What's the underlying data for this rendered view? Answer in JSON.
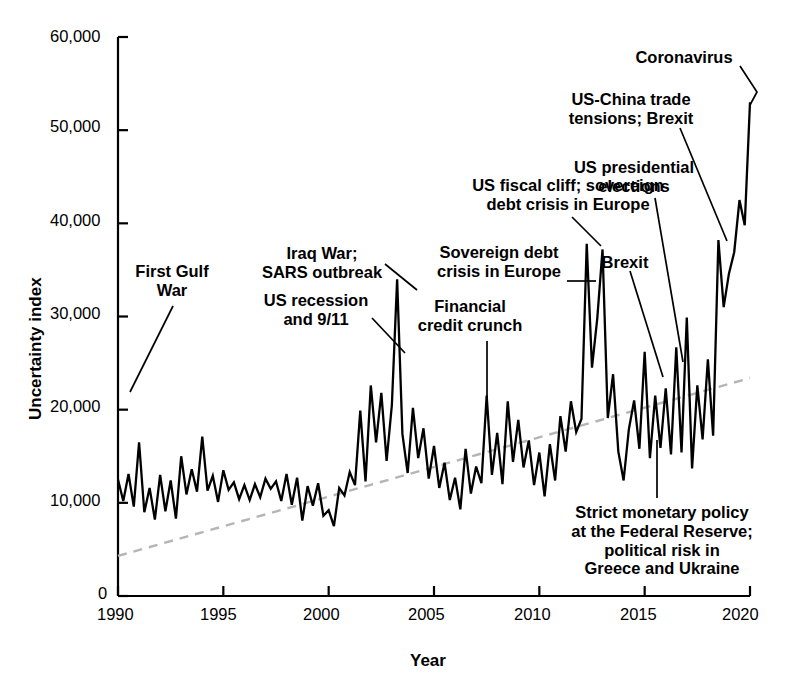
{
  "chart_data": {
    "type": "line",
    "title": "",
    "xlabel": "Year",
    "ylabel": "Uncertainty index",
    "xlim": [
      1990,
      2020
    ],
    "ylim": [
      0,
      60000
    ],
    "grid": false,
    "legend": "none",
    "xticks": [
      "1990",
      "1995",
      "2000",
      "2005",
      "2010",
      "2015",
      "2020"
    ],
    "xtick_values": [
      1990,
      1995,
      2000,
      2005,
      2010,
      2015,
      2020
    ],
    "yticks": [
      "0",
      "10,000",
      "20,000",
      "30,000",
      "40,000",
      "50,000",
      "60,000"
    ],
    "ytick_values": [
      0,
      10000,
      20000,
      30000,
      40000,
      50000,
      60000
    ],
    "series": [
      {
        "name": "Uncertainty index",
        "style": "solid",
        "color": "#000000",
        "x": [
          1990.0,
          1990.25,
          1990.5,
          1990.75,
          1991.0,
          1991.25,
          1991.5,
          1991.75,
          1992.0,
          1992.25,
          1992.5,
          1992.75,
          1993.0,
          1993.25,
          1993.5,
          1993.75,
          1994.0,
          1994.25,
          1994.5,
          1994.75,
          1995.0,
          1995.25,
          1995.5,
          1995.75,
          1996.0,
          1996.25,
          1996.5,
          1996.75,
          1997.0,
          1997.25,
          1997.5,
          1997.75,
          1998.0,
          1998.25,
          1998.5,
          1998.75,
          1999.0,
          1999.25,
          1999.5,
          1999.75,
          2000.0,
          2000.25,
          2000.5,
          2000.75,
          2001.0,
          2001.25,
          2001.5,
          2001.75,
          2002.0,
          2002.25,
          2002.5,
          2002.75,
          2003.0,
          2003.25,
          2003.5,
          2003.75,
          2004.0,
          2004.25,
          2004.5,
          2004.75,
          2005.0,
          2005.25,
          2005.5,
          2005.75,
          2006.0,
          2006.25,
          2006.5,
          2006.75,
          2007.0,
          2007.25,
          2007.5,
          2007.75,
          2008.0,
          2008.25,
          2008.5,
          2008.75,
          2009.0,
          2009.25,
          2009.5,
          2009.75,
          2010.0,
          2010.25,
          2010.5,
          2010.75,
          2011.0,
          2011.25,
          2011.5,
          2011.75,
          2012.0,
          2012.25,
          2012.5,
          2012.75,
          2013.0,
          2013.25,
          2013.5,
          2013.75,
          2014.0,
          2014.25,
          2014.5,
          2014.75,
          2015.0,
          2015.25,
          2015.5,
          2015.75,
          2016.0,
          2016.25,
          2016.5,
          2016.75,
          2017.0,
          2017.25,
          2017.5,
          2017.75,
          2018.0,
          2018.25,
          2018.5,
          2018.75,
          2019.0,
          2019.25,
          2019.5,
          2019.75,
          2020.0
        ],
        "values": [
          12500,
          10200,
          13100,
          9600,
          16500,
          9000,
          11600,
          8200,
          13000,
          9100,
          12400,
          8300,
          15000,
          10900,
          13600,
          11200,
          17100,
          11300,
          12900,
          10100,
          13500,
          11400,
          12200,
          10400,
          11900,
          10300,
          12000,
          10600,
          12600,
          11500,
          12300,
          10200,
          13100,
          9800,
          12700,
          8100,
          11800,
          9700,
          12100,
          8600,
          9200,
          7500,
          11600,
          10800,
          13300,
          11900,
          19900,
          12300,
          22600,
          16500,
          21800,
          14500,
          20500,
          34000,
          17400,
          13200,
          20200,
          14800,
          18000,
          12600,
          16100,
          11600,
          14300,
          10300,
          12700,
          9300,
          15800,
          11000,
          13900,
          12100,
          21500,
          13000,
          17500,
          12000,
          20900,
          14400,
          18900,
          13800,
          16700,
          11900,
          15400,
          10700,
          16300,
          12400,
          19300,
          15500,
          20900,
          17600,
          19000,
          37800,
          24500,
          29800,
          37200,
          19100,
          23800,
          15500,
          12400,
          17900,
          21000,
          15800,
          26200,
          14800,
          21500,
          15900,
          22300,
          15200,
          26700,
          15400,
          29900,
          13700,
          22600,
          16800,
          25400,
          17200,
          38200,
          31000,
          34600,
          36900,
          42500,
          39800,
          53000
        ]
      },
      {
        "name": "Trend",
        "style": "dashed",
        "color": "#b5b5b5",
        "x": [
          1990,
          2020
        ],
        "values": [
          4300,
          23400
        ]
      }
    ],
    "annotations": [
      {
        "id": "first-gulf-war",
        "text": [
          "First Gulf",
          "War"
        ],
        "align": "center",
        "text_x": 172,
        "text_y": 262,
        "leader": [
          [
            173,
            306
          ],
          [
            130,
            392
          ]
        ]
      },
      {
        "id": "us-recession-911",
        "text": [
          "US recession",
          "and 9/11"
        ],
        "align": "center",
        "text_x": 316,
        "text_y": 291,
        "leader": [
          [
            372,
            318
          ],
          [
            405,
            353
          ]
        ]
      },
      {
        "id": "iraq-war-sars",
        "text": [
          "Iraq War;",
          "SARS outbreak"
        ],
        "align": "center",
        "text_x": 322,
        "text_y": 244,
        "leader": [
          [
            385,
            264
          ],
          [
            417,
            290
          ]
        ]
      },
      {
        "id": "financial-credit-crunch",
        "text": [
          "Financial",
          "credit crunch"
        ],
        "align": "center",
        "text_x": 470,
        "text_y": 297,
        "leader": [
          [
            487,
            341
          ],
          [
            487,
            399
          ]
        ]
      },
      {
        "id": "us-fiscal-cliff",
        "text": [
          "US fiscal cliff; sovereign",
          "debt crisis in Europe"
        ],
        "align": "center",
        "text_x": 568,
        "text_y": 176,
        "leader": [
          [
            572,
            217
          ],
          [
            601,
            246
          ]
        ]
      },
      {
        "id": "sovereign-debt-crisis",
        "text": [
          "Sovereign debt",
          "crisis in Europe"
        ],
        "align": "center",
        "text_x": 499,
        "text_y": 243,
        "leader": [
          [
            567,
            281
          ],
          [
            596,
            281
          ]
        ]
      },
      {
        "id": "brexit-2016",
        "text": [
          "Brexit"
        ],
        "align": "center",
        "text_x": 625,
        "text_y": 253,
        "leader": [
          [
            630,
            271
          ],
          [
            663,
            377
          ]
        ]
      },
      {
        "id": "us-presidential-elections",
        "text": [
          "US presidential",
          "elections"
        ],
        "align": "center",
        "text_x": 634,
        "text_y": 158,
        "leader": [
          [
            655,
            198
          ],
          [
            683,
            362
          ]
        ]
      },
      {
        "id": "us-china-trade-brexit",
        "text": [
          "US-China trade",
          "tensions; Brexit"
        ],
        "align": "center",
        "text_x": 631,
        "text_y": 90,
        "leader": [
          [
            680,
            128
          ],
          [
            727,
            241
          ]
        ]
      },
      {
        "id": "coronavirus",
        "text": [
          "Coronavirus"
        ],
        "align": "center",
        "text_x": 684,
        "text_y": 48,
        "leader": [
          [
            740,
            66
          ],
          [
            757,
            92
          ],
          [
            750,
            105
          ]
        ]
      },
      {
        "id": "strict-monetary-policy",
        "text": [
          "Strict monetary policy",
          "at the Federal Reserve;",
          "political risk in",
          "Greece and Ukraine"
        ],
        "align": "center",
        "text_x": 662,
        "text_y": 503,
        "leader": [
          [
            657,
            498
          ],
          [
            657,
            440
          ]
        ]
      }
    ]
  },
  "axis": {
    "y_title": "Uncertainty index",
    "x_title": "Year"
  }
}
